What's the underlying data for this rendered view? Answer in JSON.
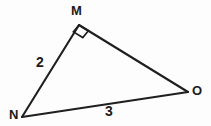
{
  "figure": {
    "kind": "right-triangle-diagram",
    "background_color": "#fdfdfd",
    "stroke_color": "#1f1f1f",
    "stroke_width": 2,
    "text_color": "#1b1b1b",
    "vertices": [
      {
        "name": "M",
        "label": "M",
        "x": 79,
        "y": 25,
        "right_angle": true
      },
      {
        "name": "N",
        "label": "N",
        "x": 22,
        "y": 117,
        "right_angle": false
      },
      {
        "name": "O",
        "label": "O",
        "x": 188,
        "y": 92,
        "right_angle": false
      }
    ],
    "sides": [
      {
        "name": "MN",
        "from": "M",
        "to": "N",
        "label": "2",
        "label_x": 41,
        "label_y": 63
      },
      {
        "name": "NO",
        "from": "N",
        "to": "O",
        "label": "3",
        "label_x": 111,
        "label_y": 113
      },
      {
        "name": "MO",
        "from": "M",
        "to": "O",
        "label": "",
        "label_x": 0,
        "label_y": 0
      }
    ],
    "right_angle_marker": {
      "at_vertex": "M",
      "size": 11,
      "symbol_name": "right-angle-square"
    },
    "labels": {
      "vertex_m": "M",
      "vertex_n": "N",
      "vertex_o": "O",
      "side_mn": "2",
      "side_no": "3"
    }
  }
}
